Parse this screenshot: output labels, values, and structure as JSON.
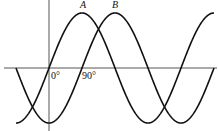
{
  "diagram": {
    "type": "phase-shifted sine waves",
    "waves": [
      {
        "name": "A",
        "label": "A",
        "phase_deg": 0
      },
      {
        "name": "B",
        "label": "B",
        "phase_deg": -90
      }
    ],
    "x_range_deg": [
      -90,
      450
    ],
    "tick_labels": [
      "0°",
      "90°"
    ],
    "colors": {
      "curve": "#111111",
      "axis": "#555555",
      "background": "#ffffff"
    }
  }
}
